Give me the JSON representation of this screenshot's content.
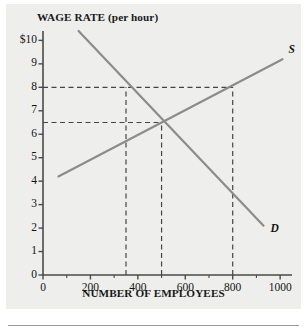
{
  "figure": {
    "background_color": "#eeeeec",
    "curve_color": "#8c8c8c",
    "axis_color": "#4a4a4a",
    "dash_color": "#444444"
  },
  "chart_data": {
    "type": "line",
    "title": "",
    "ylabel": "WAGE RATE (per hour)",
    "xlabel": "NUMBER OF EMPLOYEES",
    "xlim": [
      0,
      1050
    ],
    "ylim": [
      0,
      10.4
    ],
    "grid": false,
    "legend": "inline-curve-labels",
    "x_ticks": [
      0,
      200,
      400,
      600,
      800,
      1000
    ],
    "x_tick_labels": [
      "0",
      "200",
      "400",
      "600",
      "800",
      "1000"
    ],
    "x_minor_ticks": [
      100,
      300,
      500,
      700,
      900
    ],
    "y_ticks": [
      0,
      1,
      2,
      3,
      4,
      5,
      6,
      7,
      8,
      9,
      10
    ],
    "y_tick_labels": [
      "0",
      "1",
      "2",
      "3",
      "4",
      "5",
      "6",
      "7",
      "8",
      "9",
      "$10"
    ],
    "series": [
      {
        "name": "S",
        "label": "S",
        "role": "supply",
        "points": [
          [
            65,
            4.2
          ],
          [
            1010,
            9.2
          ]
        ]
      },
      {
        "name": "D",
        "label": "D",
        "role": "demand",
        "points": [
          [
            150,
            10.4
          ],
          [
            930,
            2.1
          ]
        ]
      }
    ],
    "annotations": [
      {
        "name": "wage-8-guideline",
        "type": "hline",
        "y": 8,
        "x_from": 0,
        "x_to": 800
      },
      {
        "name": "equilibrium-wage-guideline",
        "type": "hline",
        "y": 6.5,
        "x_from": 0,
        "x_to": 500
      },
      {
        "name": "quantity-demanded-at-8-guideline",
        "type": "vline",
        "x": 350,
        "y_from": 0,
        "y_to": 8
      },
      {
        "name": "equilibrium-quantity-guideline",
        "type": "vline",
        "x": 500,
        "y_from": 0,
        "y_to": 6.5
      },
      {
        "name": "quantity-supplied-at-8-guideline",
        "type": "vline",
        "x": 800,
        "y_from": 0,
        "y_to": 8
      }
    ],
    "equilibrium": {
      "quantity": 500,
      "wage": 6.5
    },
    "minimum_wage": {
      "wage": 8,
      "quantity_demanded": 350,
      "quantity_supplied": 800
    }
  }
}
